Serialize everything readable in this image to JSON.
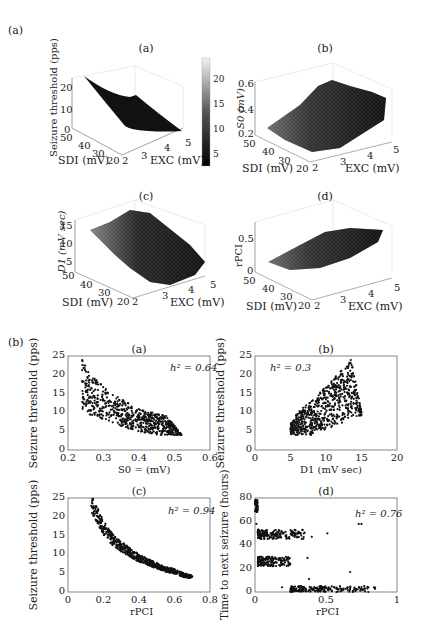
{
  "figure": {
    "part_a_label": "(a)",
    "part_b_label": "(b)"
  },
  "chart_data": [
    {
      "type": "surface3d",
      "panel": "(a)",
      "title": "(a)",
      "xlabel": "EXC (mV)",
      "ylabel": "SDI (mV)",
      "zlabel": "Seizure threshold (pps)",
      "xticks": [
        "2",
        "3",
        "4",
        "5"
      ],
      "yticks": [
        "20",
        "30",
        "40",
        "50"
      ],
      "zticks": [
        "0",
        "10",
        "20"
      ],
      "colorbar_ticks": [
        "5",
        "10",
        "15",
        "20"
      ],
      "colorbar_range": [
        3,
        24
      ],
      "description": "Smooth surface decreasing from ~24 pps at EXC=2,SDI=50 to ~3 pps at EXC=5,SDI=20"
    },
    {
      "type": "surface3d",
      "panel": "(b)",
      "title": "(b)",
      "xlabel": "EXC (mV)",
      "ylabel": "SDI (mV)",
      "zlabel": "S0 (mV)",
      "xticks": [
        "2",
        "3",
        "4",
        "5"
      ],
      "yticks": [
        "20",
        "30",
        "40",
        "50"
      ],
      "zticks": [
        "0.2",
        "0.4",
        "0.6"
      ],
      "description": "Noisy surface increasing from ~0.25 at low EXC to ~0.5 at high EXC"
    },
    {
      "type": "surface3d",
      "panel": "(c)",
      "title": "(c)",
      "xlabel": "EXC (mV)",
      "ylabel": "SDI (mV)",
      "zlabel": "D1 (mV sec)",
      "xticks": [
        "2",
        "3",
        "4",
        "5"
      ],
      "yticks": [
        "20",
        "30",
        "40",
        "50"
      ],
      "zticks": [
        "5",
        "10",
        "15"
      ],
      "description": "Noisy surface, high (~15) at EXC=2,SDI=50 decreasing toward ~5 at EXC=5,SDI=20"
    },
    {
      "type": "surface3d",
      "panel": "(d)",
      "title": "(d)",
      "xlabel": "EXC (mV)",
      "ylabel": "SDI (mV)",
      "zlabel": "rPCI",
      "xticks": [
        "2",
        "3",
        "4",
        "5"
      ],
      "yticks": [
        "20",
        "30",
        "40",
        "50"
      ],
      "zticks": [
        "0",
        "0.5"
      ],
      "description": "Noisy surface increasing from ~0.2 at low EXC to ~0.7 at high EXC"
    },
    {
      "type": "scatter",
      "panel": "(a)",
      "title": "(a)",
      "xlabel": "S0 = (mV)",
      "ylabel": "Seizure threshold (pps)",
      "xlim": [
        0.2,
        0.6
      ],
      "ylim": [
        0,
        25
      ],
      "xticks": [
        "0.2",
        "0.3",
        "0.4",
        "0.5",
        "0.6"
      ],
      "yticks": [
        "0",
        "5",
        "10",
        "15",
        "20",
        "25"
      ],
      "annotation": "h² = 0.64",
      "trend": "inverse band: y≈25→4 as x 0.23→0.52, band width ~8 pps",
      "x": [
        0.24,
        0.25,
        0.27,
        0.3,
        0.33,
        0.36,
        0.4,
        0.44,
        0.48,
        0.52
      ],
      "y_upper": [
        25,
        23,
        20,
        17,
        15,
        13,
        11,
        10,
        9,
        4
      ],
      "y_lower": [
        11,
        10,
        9,
        8,
        7,
        6,
        5,
        4,
        4,
        4
      ]
    },
    {
      "type": "scatter",
      "panel": "(b)",
      "title": "(b)",
      "xlabel": "D1 (mV sec)",
      "ylabel": "Seizure threshold (pps)",
      "xlim": [
        0,
        20
      ],
      "ylim": [
        0,
        25
      ],
      "xticks": [
        "0",
        "5",
        "10",
        "15",
        "20"
      ],
      "yticks": [
        "0",
        "5",
        "10",
        "15",
        "20",
        "25"
      ],
      "annotation": "h² = 0.3",
      "trend": "fan shape: points between x=5 and 15, y from 4 rising to 25 near x≈13.5",
      "x": [
        5,
        6,
        7,
        8,
        9,
        10,
        11,
        12,
        13,
        13.5,
        14,
        15
      ],
      "y_upper": [
        7,
        10,
        12,
        13,
        15,
        17,
        19,
        21,
        23,
        25,
        20,
        10
      ],
      "y_lower": [
        4,
        4,
        4,
        4,
        5,
        5,
        6,
        7,
        8,
        9,
        9,
        9
      ]
    },
    {
      "type": "scatter",
      "panel": "(c)",
      "title": "(c)",
      "xlabel": "rPCI",
      "ylabel": "Seizure threshold (pps)",
      "xlim": [
        0,
        0.8
      ],
      "ylim": [
        0,
        25
      ],
      "xticks": [
        "0",
        "0.2",
        "0.4",
        "0.6",
        "0.8"
      ],
      "yticks": [
        "0",
        "5",
        "10",
        "15",
        "20",
        "25"
      ],
      "annotation": "h² = 0.94",
      "trend": "tight inverse curve",
      "x": [
        0.13,
        0.15,
        0.2,
        0.25,
        0.3,
        0.35,
        0.4,
        0.45,
        0.5,
        0.55,
        0.6,
        0.65,
        0.7
      ],
      "y": [
        24,
        22,
        17,
        14,
        12,
        10.5,
        9,
        8,
        7,
        6,
        5.5,
        4.5,
        4
      ]
    },
    {
      "type": "scatter",
      "panel": "(d)",
      "title": "(d)",
      "xlabel": "rPCI",
      "ylabel": "Time to next seizure (hours)",
      "xlim": [
        0,
        1
      ],
      "ylim": [
        0,
        80
      ],
      "xticks": [
        "0",
        "0.5",
        "1"
      ],
      "yticks": [
        "0",
        "20",
        "40",
        "60",
        "80"
      ],
      "annotation": "h² = 0.76",
      "clusters": [
        {
          "x_range": [
            0,
            0.02
          ],
          "y_range": [
            68,
            78
          ]
        },
        {
          "x_range": [
            0.02,
            0.35
          ],
          "y_range": [
            45,
            53
          ]
        },
        {
          "x_range": [
            0.02,
            0.25
          ],
          "y_range": [
            22,
            30
          ]
        },
        {
          "x_range": [
            0.25,
            0.85
          ],
          "y_range": [
            0,
            5
          ]
        }
      ],
      "outliers": [
        [
          0.01,
          58
        ],
        [
          0.73,
          58
        ],
        [
          0.75,
          58
        ],
        [
          0.67,
          17
        ],
        [
          0.38,
          11
        ],
        [
          0.37,
          29
        ],
        [
          0.19,
          4
        ],
        [
          0.51,
          50
        ],
        [
          0.4,
          47
        ]
      ]
    }
  ]
}
